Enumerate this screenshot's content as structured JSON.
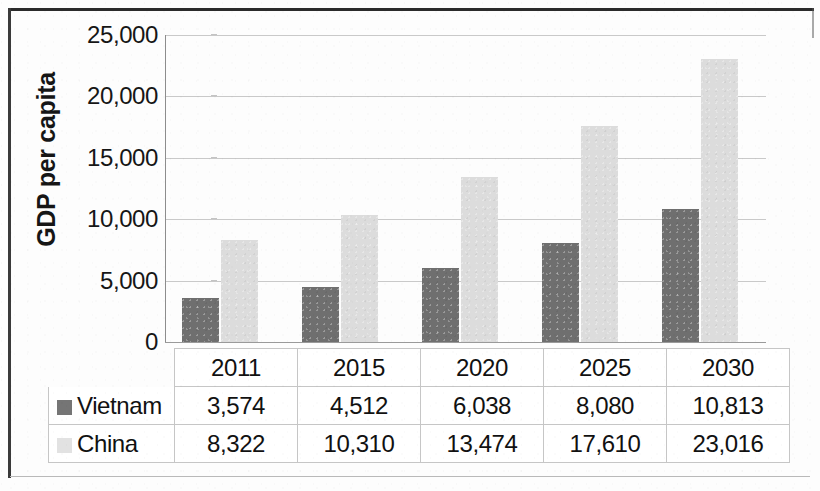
{
  "chart_data": {
    "type": "bar",
    "title": "",
    "subtitle": "",
    "xlabel": "",
    "ylabel": "GDP per capita",
    "categories": [
      "2011",
      "2015",
      "2020",
      "2025",
      "2030"
    ],
    "series": [
      {
        "name": "Vietnam",
        "color": "#6f6f6f",
        "values": [
          3574,
          4512,
          6038,
          8080,
          10813
        ],
        "labels": [
          "3,574",
          "4,512",
          "6,038",
          "8,080",
          "10,813"
        ]
      },
      {
        "name": "China",
        "color": "#dcdcdc",
        "values": [
          8322,
          10310,
          13474,
          17610,
          23016
        ],
        "labels": [
          "8,322",
          "10,310",
          "13,474",
          "17,610",
          "23,016"
        ]
      }
    ],
    "ylim": [
      0,
      25000
    ],
    "ytick_values": [
      25000,
      20000,
      15000,
      10000,
      5000,
      0
    ],
    "ytick_labels": [
      "25,000",
      "20,000",
      "15,000",
      "10,000",
      "5,000",
      "0"
    ],
    "grid": true,
    "legend_position": "data-table",
    "data_table_shown": true
  },
  "axis": {
    "y_title": "GDP per capita"
  },
  "table": {
    "header": [
      "",
      "2011",
      "2015",
      "2020",
      "2025",
      "2030"
    ],
    "rows": [
      {
        "label": "Vietnam",
        "swatch": "#757575",
        "cells": [
          "3,574",
          "4,512",
          "6,038",
          "8,080",
          "10,813"
        ]
      },
      {
        "label": "China",
        "swatch": "#e2e2e2",
        "cells": [
          "8,322",
          "10,310",
          "13,474",
          "17,610",
          "23,016"
        ]
      }
    ]
  }
}
